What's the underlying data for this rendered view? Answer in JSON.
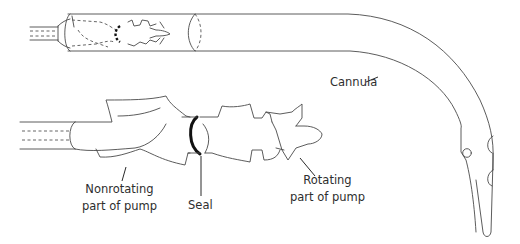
{
  "figure": {
    "colors": {
      "line": "#4a4a4a",
      "seal": "#111111",
      "text": "#2e2e2e",
      "background": "#ffffff"
    }
  },
  "labels": {
    "cannula": "Cannula",
    "nonrotating": {
      "line1": "Nonrotating",
      "line2": "part of pump"
    },
    "seal": "Seal",
    "rotating": {
      "line1": "Rotating",
      "line2": "part of pump"
    }
  }
}
